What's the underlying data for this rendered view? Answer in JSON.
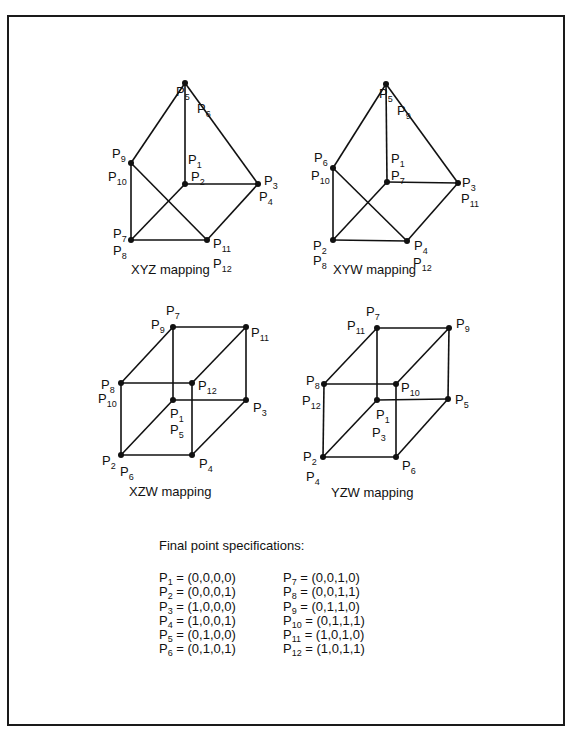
{
  "figure": {
    "diagrams": [
      {
        "id": "xyz",
        "caption": "XYZ mapping",
        "caption_pos": [
          131,
          262
        ],
        "nodes": [
          {
            "x": 185,
            "y": 83
          },
          {
            "x": 131,
            "y": 163
          },
          {
            "x": 185,
            "y": 184
          },
          {
            "x": 258,
            "y": 184
          },
          {
            "x": 131,
            "y": 240
          },
          {
            "x": 207,
            "y": 240
          }
        ],
        "edges": [
          [
            0,
            1
          ],
          [
            0,
            2
          ],
          [
            0,
            3
          ],
          [
            1,
            4
          ],
          [
            1,
            5
          ],
          [
            2,
            3
          ],
          [
            2,
            4
          ],
          [
            3,
            5
          ],
          [
            4,
            5
          ]
        ],
        "labels": [
          {
            "p": "5",
            "x": 179,
            "y": 104,
            "dx": -3,
            "dy": -8
          },
          {
            "p": "6",
            "x": 197,
            "y": 113
          },
          {
            "p": "9",
            "x": 112,
            "y": 158
          },
          {
            "p": "10",
            "x": 108,
            "y": 181
          },
          {
            "p": "1",
            "x": 188,
            "y": 164
          },
          {
            "p": "2",
            "x": 191,
            "y": 181
          },
          {
            "p": "3",
            "x": 264,
            "y": 185
          },
          {
            "p": "4",
            "x": 259,
            "y": 201
          },
          {
            "p": "7",
            "x": 113,
            "y": 238
          },
          {
            "p": "8",
            "x": 113,
            "y": 255
          },
          {
            "p": "11",
            "x": 213,
            "y": 248
          },
          {
            "p": "12",
            "x": 213,
            "y": 268
          }
        ]
      },
      {
        "id": "xyw",
        "caption": "XYW mapping",
        "caption_pos": [
          333,
          262
        ],
        "nodes": [
          {
            "x": 386,
            "y": 84
          },
          {
            "x": 333,
            "y": 168
          },
          {
            "x": 387,
            "y": 182
          },
          {
            "x": 458,
            "y": 183
          },
          {
            "x": 333,
            "y": 240
          },
          {
            "x": 407,
            "y": 241
          }
        ],
        "edges": [
          [
            0,
            1
          ],
          [
            0,
            2
          ],
          [
            0,
            3
          ],
          [
            1,
            4
          ],
          [
            1,
            5
          ],
          [
            2,
            3
          ],
          [
            2,
            4
          ],
          [
            3,
            5
          ],
          [
            4,
            5
          ]
        ],
        "labels": [
          {
            "p": "5",
            "x": 382,
            "y": 106,
            "dx": -3,
            "dy": -8
          },
          {
            "p": "9",
            "x": 397,
            "y": 115
          },
          {
            "p": "6",
            "x": 314,
            "y": 162
          },
          {
            "p": "10",
            "x": 311,
            "y": 180
          },
          {
            "p": "1",
            "x": 391,
            "y": 163
          },
          {
            "p": "7",
            "x": 391,
            "y": 180
          },
          {
            "p": "3",
            "x": 462,
            "y": 187
          },
          {
            "p": "11",
            "x": 461,
            "y": 203
          },
          {
            "p": "2",
            "x": 313,
            "y": 250
          },
          {
            "p": "8",
            "x": 313,
            "y": 265
          },
          {
            "p": "4",
            "x": 414,
            "y": 250
          },
          {
            "p": "12",
            "x": 413,
            "y": 267
          }
        ]
      },
      {
        "id": "xzw",
        "caption": "XZW mapping",
        "caption_pos": [
          129,
          493
        ],
        "nodes": [
          {
            "x": 173,
            "y": 327
          },
          {
            "x": 246,
            "y": 327
          },
          {
            "x": 121,
            "y": 383
          },
          {
            "x": 192,
            "y": 383
          },
          {
            "x": 173,
            "y": 400
          },
          {
            "x": 246,
            "y": 400
          },
          {
            "x": 121,
            "y": 455
          },
          {
            "x": 192,
            "y": 455
          }
        ],
        "edges": [
          [
            0,
            1
          ],
          [
            0,
            2
          ],
          [
            1,
            3
          ],
          [
            2,
            3
          ],
          [
            0,
            4
          ],
          [
            1,
            5
          ],
          [
            4,
            5
          ],
          [
            2,
            6
          ],
          [
            3,
            7
          ],
          [
            6,
            7
          ],
          [
            4,
            6
          ],
          [
            5,
            7
          ]
        ],
        "labels": [
          {
            "p": "7",
            "x": 166,
            "y": 315
          },
          {
            "p": "9",
            "x": 151,
            "y": 329
          },
          {
            "p": "11",
            "x": 251,
            "y": 337
          },
          {
            "p": "8",
            "x": 101,
            "y": 389
          },
          {
            "p": "10",
            "x": 98,
            "y": 403
          },
          {
            "p": "12",
            "x": 198,
            "y": 390
          },
          {
            "p": "1",
            "x": 170,
            "y": 418
          },
          {
            "p": "5",
            "x": 170,
            "y": 434
          },
          {
            "p": "3",
            "x": 253,
            "y": 412
          },
          {
            "p": "2",
            "x": 102,
            "y": 465
          },
          {
            "p": "6",
            "x": 120,
            "y": 476
          },
          {
            "p": "4",
            "x": 199,
            "y": 468
          }
        ]
      },
      {
        "id": "yzw",
        "caption": "YZW mapping",
        "caption_pos": [
          331,
          494
        ],
        "nodes": [
          {
            "x": 377,
            "y": 328
          },
          {
            "x": 449,
            "y": 328
          },
          {
            "x": 324,
            "y": 384
          },
          {
            "x": 396,
            "y": 384
          },
          {
            "x": 377,
            "y": 400
          },
          {
            "x": 448,
            "y": 399
          },
          {
            "x": 323,
            "y": 457
          },
          {
            "x": 396,
            "y": 457
          }
        ],
        "edges": [
          [
            0,
            1
          ],
          [
            0,
            2
          ],
          [
            1,
            3
          ],
          [
            2,
            3
          ],
          [
            0,
            4
          ],
          [
            1,
            5
          ],
          [
            4,
            5
          ],
          [
            2,
            6
          ],
          [
            3,
            7
          ],
          [
            6,
            7
          ],
          [
            4,
            6
          ],
          [
            5,
            7
          ]
        ],
        "labels": [
          {
            "p": "7",
            "x": 366,
            "y": 316
          },
          {
            "p": "11",
            "x": 347,
            "y": 330
          },
          {
            "p": "9",
            "x": 456,
            "y": 328
          },
          {
            "p": "8",
            "x": 306,
            "y": 385
          },
          {
            "p": "12",
            "x": 302,
            "y": 405
          },
          {
            "p": "10",
            "x": 401,
            "y": 392
          },
          {
            "p": "1",
            "x": 376,
            "y": 419
          },
          {
            "p": "3",
            "x": 372,
            "y": 437
          },
          {
            "p": "5",
            "x": 455,
            "y": 404
          },
          {
            "p": "2",
            "x": 303,
            "y": 461
          },
          {
            "p": "4",
            "x": 306,
            "y": 481
          },
          {
            "p": "6",
            "x": 402,
            "y": 470
          }
        ]
      }
    ],
    "specifications": {
      "title": "Final point specifications:",
      "left": [
        {
          "p": "1",
          "value": " = (0,0,0,0)"
        },
        {
          "p": "2",
          "value": " = (0,0,0,1)"
        },
        {
          "p": "3",
          "value": " = (1,0,0,0)"
        },
        {
          "p": "4",
          "value": " = (1,0,0,1)"
        },
        {
          "p": "5",
          "value": " = (0,1,0,0)"
        },
        {
          "p": "6",
          "value": " = (0,1,0,1)"
        }
      ],
      "right": [
        {
          "p": "7",
          "value": " = (0,0,1,0)"
        },
        {
          "p": "8",
          "value": " = (0,0,1,1)"
        },
        {
          "p": "9",
          "value": " = (0,1,1,0)"
        },
        {
          "p": "10",
          "value": " = (0,1,1,1)"
        },
        {
          "p": "11",
          "value": " = (1,0,1,0)"
        },
        {
          "p": "12",
          "value": " = (1,0,1,1)"
        }
      ]
    }
  }
}
